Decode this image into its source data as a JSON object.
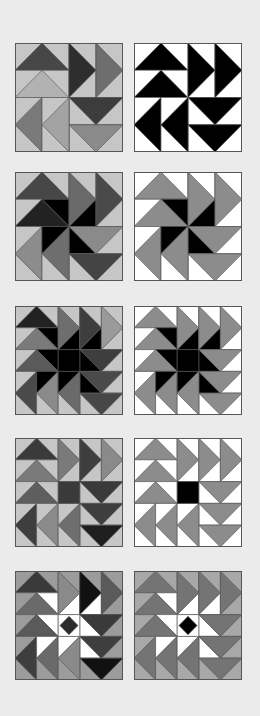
{
  "palette": {
    "page_bg": "#ebebeb",
    "white": "#ffffff",
    "light": "#c6c6c6",
    "light2": "#b4b4b4",
    "mid": "#8c8c8c",
    "mid2": "#7a7a7a",
    "dark": "#4a4a4a",
    "darker": "#333333",
    "black": "#000000",
    "outline": "#555555"
  },
  "blocks": [
    {
      "id": "r1-left",
      "x": 15,
      "y": 43,
      "grid": 4,
      "sky": "#c6c6c6",
      "geese": [
        {
          "c": 0,
          "r": 0,
          "w": 2,
          "h": 1,
          "dir": "up",
          "fill": "#474747"
        },
        {
          "c": 0,
          "r": 1,
          "w": 2,
          "h": 1,
          "dir": "up",
          "fill": "#b2b2b2"
        },
        {
          "c": 2,
          "r": 0,
          "w": 1,
          "h": 2,
          "dir": "right",
          "fill": "#2e2e2e"
        },
        {
          "c": 3,
          "r": 0,
          "w": 1,
          "h": 2,
          "dir": "right",
          "fill": "#6e6e6e"
        },
        {
          "c": 2,
          "r": 2,
          "w": 2,
          "h": 1,
          "dir": "down",
          "fill": "#3c3c3c"
        },
        {
          "c": 2,
          "r": 3,
          "w": 2,
          "h": 1,
          "dir": "down",
          "fill": "#8a8a8a"
        },
        {
          "c": 0,
          "r": 2,
          "w": 1,
          "h": 2,
          "dir": "left",
          "fill": "#7a7a7a"
        },
        {
          "c": 1,
          "r": 2,
          "w": 1,
          "h": 2,
          "dir": "left",
          "fill": "#a3a3a3"
        }
      ],
      "center": null,
      "star": null
    },
    {
      "id": "r1-right",
      "x": 134,
      "y": 43,
      "grid": 4,
      "sky": "#ffffff",
      "geese": [
        {
          "c": 0,
          "r": 0,
          "w": 2,
          "h": 1,
          "dir": "up",
          "fill": "#000000"
        },
        {
          "c": 0,
          "r": 1,
          "w": 2,
          "h": 1,
          "dir": "up",
          "fill": "#000000"
        },
        {
          "c": 2,
          "r": 0,
          "w": 1,
          "h": 2,
          "dir": "right",
          "fill": "#000000"
        },
        {
          "c": 3,
          "r": 0,
          "w": 1,
          "h": 2,
          "dir": "right",
          "fill": "#000000"
        },
        {
          "c": 2,
          "r": 2,
          "w": 2,
          "h": 1,
          "dir": "down",
          "fill": "#000000"
        },
        {
          "c": 2,
          "r": 3,
          "w": 2,
          "h": 1,
          "dir": "down",
          "fill": "#000000"
        },
        {
          "c": 0,
          "r": 2,
          "w": 1,
          "h": 2,
          "dir": "left",
          "fill": "#000000"
        },
        {
          "c": 1,
          "r": 2,
          "w": 1,
          "h": 2,
          "dir": "left",
          "fill": "#000000"
        }
      ],
      "center": null,
      "star": null
    },
    {
      "id": "r2-left",
      "x": 15,
      "y": 172,
      "grid": 4,
      "sky": "#c6c6c6",
      "geese": [
        {
          "c": 0,
          "r": 0,
          "w": 2,
          "h": 1,
          "dir": "up",
          "fill": "#474747"
        },
        {
          "c": 0,
          "r": 1,
          "w": 2,
          "h": 1,
          "dir": "up",
          "fill": "#222222"
        },
        {
          "c": 2,
          "r": 0,
          "w": 1,
          "h": 2,
          "dir": "right",
          "fill": "#6a6a6a"
        },
        {
          "c": 3,
          "r": 0,
          "w": 1,
          "h": 2,
          "dir": "right",
          "fill": "#4a4a4a"
        },
        {
          "c": 2,
          "r": 2,
          "w": 2,
          "h": 1,
          "dir": "down",
          "fill": "#8a8a8a"
        },
        {
          "c": 2,
          "r": 3,
          "w": 2,
          "h": 1,
          "dir": "down",
          "fill": "#444444"
        },
        {
          "c": 0,
          "r": 2,
          "w": 1,
          "h": 2,
          "dir": "left",
          "fill": "#8c8c8c"
        },
        {
          "c": 1,
          "r": 2,
          "w": 1,
          "h": 2,
          "dir": "left",
          "fill": "#6e6e6e"
        }
      ],
      "center": null,
      "star": {
        "type": "pinwheel4",
        "fill": "#000000"
      }
    },
    {
      "id": "r2-right",
      "x": 134,
      "y": 172,
      "grid": 4,
      "sky": "#ffffff",
      "geese": [
        {
          "c": 0,
          "r": 0,
          "w": 2,
          "h": 1,
          "dir": "up",
          "fill": "#8c8c8c"
        },
        {
          "c": 0,
          "r": 1,
          "w": 2,
          "h": 1,
          "dir": "up",
          "fill": "#8c8c8c"
        },
        {
          "c": 2,
          "r": 0,
          "w": 1,
          "h": 2,
          "dir": "right",
          "fill": "#8c8c8c"
        },
        {
          "c": 3,
          "r": 0,
          "w": 1,
          "h": 2,
          "dir": "right",
          "fill": "#8c8c8c"
        },
        {
          "c": 2,
          "r": 2,
          "w": 2,
          "h": 1,
          "dir": "down",
          "fill": "#8c8c8c"
        },
        {
          "c": 2,
          "r": 3,
          "w": 2,
          "h": 1,
          "dir": "down",
          "fill": "#8c8c8c"
        },
        {
          "c": 0,
          "r": 2,
          "w": 1,
          "h": 2,
          "dir": "left",
          "fill": "#8c8c8c"
        },
        {
          "c": 1,
          "r": 2,
          "w": 1,
          "h": 2,
          "dir": "left",
          "fill": "#8c8c8c"
        }
      ],
      "center": null,
      "star": {
        "type": "pinwheel4",
        "fill": "#000000"
      }
    },
    {
      "id": "r3-left",
      "x": 15,
      "y": 306,
      "grid": 5,
      "sky": "#c6c6c6",
      "geese": [
        {
          "c": 0,
          "r": 0,
          "w": 2,
          "h": 1,
          "dir": "up",
          "fill": "#222222"
        },
        {
          "c": 0,
          "r": 1,
          "w": 2,
          "h": 1,
          "dir": "up",
          "fill": "#7a7a7a"
        },
        {
          "c": 0,
          "r": 2,
          "w": 2,
          "h": 1,
          "dir": "up",
          "fill": "#5a5a5a"
        },
        {
          "c": 2,
          "r": 0,
          "w": 1,
          "h": 2,
          "dir": "right",
          "fill": "#6e6e6e"
        },
        {
          "c": 3,
          "r": 0,
          "w": 1,
          "h": 2,
          "dir": "right",
          "fill": "#3e3e3e"
        },
        {
          "c": 4,
          "r": 0,
          "w": 1,
          "h": 2,
          "dir": "right",
          "fill": "#9a9a9a"
        },
        {
          "c": 3,
          "r": 2,
          "w": 2,
          "h": 1,
          "dir": "down",
          "fill": "#3e3e3e"
        },
        {
          "c": 3,
          "r": 3,
          "w": 2,
          "h": 1,
          "dir": "down",
          "fill": "#4a4a4a"
        },
        {
          "c": 3,
          "r": 4,
          "w": 2,
          "h": 1,
          "dir": "down",
          "fill": "#474747"
        },
        {
          "c": 0,
          "r": 3,
          "w": 1,
          "h": 2,
          "dir": "left",
          "fill": "#4a4a4a"
        },
        {
          "c": 1,
          "r": 3,
          "w": 1,
          "h": 2,
          "dir": "left",
          "fill": "#8a8a8a"
        },
        {
          "c": 2,
          "r": 3,
          "w": 1,
          "h": 2,
          "dir": "left",
          "fill": "#6a6a6a"
        }
      ],
      "center": {
        "type": "square",
        "fill": "#000000"
      },
      "star": {
        "type": "pinwheel5",
        "fill": "#000000"
      }
    },
    {
      "id": "r3-right",
      "x": 134,
      "y": 306,
      "grid": 5,
      "sky": "#ffffff",
      "geese": [
        {
          "c": 0,
          "r": 0,
          "w": 2,
          "h": 1,
          "dir": "up",
          "fill": "#8c8c8c"
        },
        {
          "c": 0,
          "r": 1,
          "w": 2,
          "h": 1,
          "dir": "up",
          "fill": "#8c8c8c"
        },
        {
          "c": 0,
          "r": 2,
          "w": 2,
          "h": 1,
          "dir": "up",
          "fill": "#8c8c8c"
        },
        {
          "c": 2,
          "r": 0,
          "w": 1,
          "h": 2,
          "dir": "right",
          "fill": "#8c8c8c"
        },
        {
          "c": 3,
          "r": 0,
          "w": 1,
          "h": 2,
          "dir": "right",
          "fill": "#8c8c8c"
        },
        {
          "c": 4,
          "r": 0,
          "w": 1,
          "h": 2,
          "dir": "right",
          "fill": "#8c8c8c"
        },
        {
          "c": 3,
          "r": 2,
          "w": 2,
          "h": 1,
          "dir": "down",
          "fill": "#8c8c8c"
        },
        {
          "c": 3,
          "r": 3,
          "w": 2,
          "h": 1,
          "dir": "down",
          "fill": "#8c8c8c"
        },
        {
          "c": 3,
          "r": 4,
          "w": 2,
          "h": 1,
          "dir": "down",
          "fill": "#8c8c8c"
        },
        {
          "c": 0,
          "r": 3,
          "w": 1,
          "h": 2,
          "dir": "left",
          "fill": "#8c8c8c"
        },
        {
          "c": 1,
          "r": 3,
          "w": 1,
          "h": 2,
          "dir": "left",
          "fill": "#8c8c8c"
        },
        {
          "c": 2,
          "r": 3,
          "w": 1,
          "h": 2,
          "dir": "left",
          "fill": "#8c8c8c"
        }
      ],
      "center": {
        "type": "square",
        "fill": "#000000"
      },
      "star": {
        "type": "pinwheel5",
        "fill": "#000000"
      }
    },
    {
      "id": "r4-left",
      "x": 15,
      "y": 438,
      "grid": 5,
      "sky": "#c6c6c6",
      "geese": [
        {
          "c": 0,
          "r": 0,
          "w": 2,
          "h": 1,
          "dir": "up",
          "fill": "#3a3a3a"
        },
        {
          "c": 0,
          "r": 1,
          "w": 2,
          "h": 1,
          "dir": "up",
          "fill": "#7a7a7a"
        },
        {
          "c": 0,
          "r": 2,
          "w": 2,
          "h": 1,
          "dir": "up",
          "fill": "#5e5e5e"
        },
        {
          "c": 2,
          "r": 0,
          "w": 1,
          "h": 2,
          "dir": "right",
          "fill": "#7a7a7a"
        },
        {
          "c": 3,
          "r": 0,
          "w": 1,
          "h": 2,
          "dir": "right",
          "fill": "#3e3e3e"
        },
        {
          "c": 4,
          "r": 0,
          "w": 1,
          "h": 2,
          "dir": "right",
          "fill": "#8a8a8a"
        },
        {
          "c": 3,
          "r": 2,
          "w": 2,
          "h": 1,
          "dir": "down",
          "fill": "#3a3a3a"
        },
        {
          "c": 3,
          "r": 3,
          "w": 2,
          "h": 1,
          "dir": "down",
          "fill": "#3e3e3e"
        },
        {
          "c": 3,
          "r": 4,
          "w": 2,
          "h": 1,
          "dir": "down",
          "fill": "#1e1e1e"
        },
        {
          "c": 0,
          "r": 3,
          "w": 1,
          "h": 2,
          "dir": "left",
          "fill": "#3e3e3e"
        },
        {
          "c": 1,
          "r": 3,
          "w": 1,
          "h": 2,
          "dir": "left",
          "fill": "#8a8a8a"
        },
        {
          "c": 2,
          "r": 3,
          "w": 1,
          "h": 2,
          "dir": "left",
          "fill": "#6e6e6e"
        }
      ],
      "center": {
        "type": "square",
        "fill": "#3a3a3a"
      },
      "star": null
    },
    {
      "id": "r4-right",
      "x": 134,
      "y": 438,
      "grid": 5,
      "sky": "#ffffff",
      "geese": [
        {
          "c": 0,
          "r": 0,
          "w": 2,
          "h": 1,
          "dir": "up",
          "fill": "#8c8c8c"
        },
        {
          "c": 0,
          "r": 1,
          "w": 2,
          "h": 1,
          "dir": "up",
          "fill": "#8c8c8c"
        },
        {
          "c": 0,
          "r": 2,
          "w": 2,
          "h": 1,
          "dir": "up",
          "fill": "#8c8c8c"
        },
        {
          "c": 2,
          "r": 0,
          "w": 1,
          "h": 2,
          "dir": "right",
          "fill": "#8c8c8c"
        },
        {
          "c": 3,
          "r": 0,
          "w": 1,
          "h": 2,
          "dir": "right",
          "fill": "#8c8c8c"
        },
        {
          "c": 4,
          "r": 0,
          "w": 1,
          "h": 2,
          "dir": "right",
          "fill": "#8c8c8c"
        },
        {
          "c": 3,
          "r": 2,
          "w": 2,
          "h": 1,
          "dir": "down",
          "fill": "#8c8c8c"
        },
        {
          "c": 3,
          "r": 3,
          "w": 2,
          "h": 1,
          "dir": "down",
          "fill": "#8c8c8c"
        },
        {
          "c": 3,
          "r": 4,
          "w": 2,
          "h": 1,
          "dir": "down",
          "fill": "#8c8c8c"
        },
        {
          "c": 0,
          "r": 3,
          "w": 1,
          "h": 2,
          "dir": "left",
          "fill": "#8c8c8c"
        },
        {
          "c": 1,
          "r": 3,
          "w": 1,
          "h": 2,
          "dir": "left",
          "fill": "#8c8c8c"
        },
        {
          "c": 2,
          "r": 3,
          "w": 1,
          "h": 2,
          "dir": "left",
          "fill": "#8c8c8c"
        }
      ],
      "center": {
        "type": "square",
        "fill": "#000000"
      },
      "star": null
    },
    {
      "id": "r5-left",
      "x": 15,
      "y": 571,
      "grid": 5,
      "sky": "#9c9c9c",
      "geese": [
        {
          "c": 0,
          "r": 0,
          "w": 2,
          "h": 1,
          "dir": "up",
          "fill": "#3a3a3a"
        },
        {
          "c": 0,
          "r": 1,
          "w": 2,
          "h": 1,
          "dir": "up",
          "fill": "#6a6a6a"
        },
        {
          "c": 0,
          "r": 2,
          "w": 2,
          "h": 1,
          "dir": "up",
          "fill": "#5a5a5a"
        },
        {
          "c": 2,
          "r": 0,
          "w": 1,
          "h": 2,
          "dir": "right",
          "fill": "#8a8a8a"
        },
        {
          "c": 3,
          "r": 0,
          "w": 1,
          "h": 2,
          "dir": "right",
          "fill": "#111111"
        },
        {
          "c": 4,
          "r": 0,
          "w": 1,
          "h": 2,
          "dir": "right",
          "fill": "#5a5a5a"
        },
        {
          "c": 3,
          "r": 2,
          "w": 2,
          "h": 1,
          "dir": "down",
          "fill": "#3a3a3a"
        },
        {
          "c": 3,
          "r": 3,
          "w": 2,
          "h": 1,
          "dir": "down",
          "fill": "#3e3e3e"
        },
        {
          "c": 3,
          "r": 4,
          "w": 2,
          "h": 1,
          "dir": "down",
          "fill": "#111111"
        },
        {
          "c": 0,
          "r": 3,
          "w": 1,
          "h": 2,
          "dir": "left",
          "fill": "#3e3e3e"
        },
        {
          "c": 1,
          "r": 3,
          "w": 1,
          "h": 2,
          "dir": "left",
          "fill": "#6a6a6a"
        },
        {
          "c": 2,
          "r": 3,
          "w": 1,
          "h": 2,
          "dir": "left",
          "fill": "#8a8a8a"
        }
      ],
      "center": {
        "type": "diamond",
        "fill": "#2c2c2c",
        "bg": "#ffffff"
      },
      "star": {
        "type": "pinwheel5",
        "fill": "#ffffff"
      }
    },
    {
      "id": "r5-right",
      "x": 134,
      "y": 571,
      "grid": 5,
      "sky": "#a8a8a8",
      "geese": [
        {
          "c": 0,
          "r": 0,
          "w": 2,
          "h": 1,
          "dir": "up",
          "fill": "#747474"
        },
        {
          "c": 0,
          "r": 1,
          "w": 2,
          "h": 1,
          "dir": "up",
          "fill": "#747474"
        },
        {
          "c": 0,
          "r": 2,
          "w": 2,
          "h": 1,
          "dir": "up",
          "fill": "#747474"
        },
        {
          "c": 2,
          "r": 0,
          "w": 1,
          "h": 2,
          "dir": "right",
          "fill": "#747474"
        },
        {
          "c": 3,
          "r": 0,
          "w": 1,
          "h": 2,
          "dir": "right",
          "fill": "#747474"
        },
        {
          "c": 4,
          "r": 0,
          "w": 1,
          "h": 2,
          "dir": "right",
          "fill": "#747474"
        },
        {
          "c": 3,
          "r": 2,
          "w": 2,
          "h": 1,
          "dir": "down",
          "fill": "#747474"
        },
        {
          "c": 3,
          "r": 3,
          "w": 2,
          "h": 1,
          "dir": "down",
          "fill": "#747474"
        },
        {
          "c": 3,
          "r": 4,
          "w": 2,
          "h": 1,
          "dir": "down",
          "fill": "#747474"
        },
        {
          "c": 0,
          "r": 3,
          "w": 1,
          "h": 2,
          "dir": "left",
          "fill": "#747474"
        },
        {
          "c": 1,
          "r": 3,
          "w": 1,
          "h": 2,
          "dir": "left",
          "fill": "#747474"
        },
        {
          "c": 2,
          "r": 3,
          "w": 1,
          "h": 2,
          "dir": "left",
          "fill": "#747474"
        }
      ],
      "center": {
        "type": "diamond",
        "fill": "#000000",
        "bg": "#ffffff"
      },
      "star": {
        "type": "pinwheel5",
        "fill": "#ffffff"
      }
    }
  ]
}
